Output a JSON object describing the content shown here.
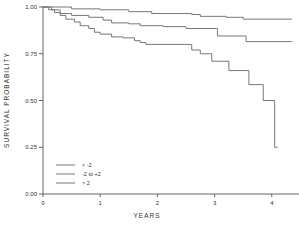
{
  "chart_data": {
    "type": "line",
    "title": "",
    "xlabel": "YEARS",
    "ylabel": "SURVIVAL PROBABILITY",
    "xlim": [
      0,
      4.35
    ],
    "ylim": [
      0,
      1.0
    ],
    "x_ticks": [
      "0",
      "1",
      "2",
      "3",
      "4"
    ],
    "y_ticks": [
      "0.00",
      "0.25",
      "0.50",
      "0.75",
      "1.00"
    ],
    "grid": false,
    "legend_position": "lower-left",
    "series": [
      {
        "name": "< -2",
        "step": true,
        "points": [
          [
            0,
            1.0
          ],
          [
            0.5,
            0.99
          ],
          [
            1.0,
            0.985
          ],
          [
            1.5,
            0.975
          ],
          [
            1.9,
            0.965
          ],
          [
            2.6,
            0.96
          ],
          [
            2.75,
            0.95
          ],
          [
            3.2,
            0.945
          ],
          [
            3.5,
            0.935
          ],
          [
            4.35,
            0.935
          ]
        ]
      },
      {
        "name": "-2 to +2",
        "step": true,
        "points": [
          [
            0,
            1.0
          ],
          [
            0.15,
            0.985
          ],
          [
            0.3,
            0.965
          ],
          [
            0.5,
            0.955
          ],
          [
            0.8,
            0.945
          ],
          [
            1.05,
            0.93
          ],
          [
            1.2,
            0.915
          ],
          [
            1.5,
            0.91
          ],
          [
            1.7,
            0.9
          ],
          [
            2.1,
            0.895
          ],
          [
            2.5,
            0.885
          ],
          [
            3.05,
            0.875
          ],
          [
            3.05,
            0.845
          ],
          [
            3.5,
            0.845
          ],
          [
            3.55,
            0.815
          ],
          [
            4.35,
            0.815
          ]
        ]
      },
      {
        "name": "> 2",
        "step": true,
        "points": [
          [
            0,
            1.0
          ],
          [
            0.1,
            0.985
          ],
          [
            0.2,
            0.97
          ],
          [
            0.3,
            0.955
          ],
          [
            0.4,
            0.935
          ],
          [
            0.55,
            0.92
          ],
          [
            0.65,
            0.9
          ],
          [
            0.8,
            0.885
          ],
          [
            0.9,
            0.865
          ],
          [
            1.0,
            0.855
          ],
          [
            1.2,
            0.84
          ],
          [
            1.4,
            0.835
          ],
          [
            1.6,
            0.82
          ],
          [
            1.7,
            0.81
          ],
          [
            1.8,
            0.8
          ],
          [
            2.6,
            0.8
          ],
          [
            2.6,
            0.77
          ],
          [
            2.75,
            0.77
          ],
          [
            2.75,
            0.75
          ],
          [
            2.95,
            0.75
          ],
          [
            2.95,
            0.71
          ],
          [
            3.25,
            0.71
          ],
          [
            3.25,
            0.66
          ],
          [
            3.6,
            0.66
          ],
          [
            3.6,
            0.585
          ],
          [
            3.85,
            0.585
          ],
          [
            3.85,
            0.5
          ],
          [
            4.05,
            0.5
          ],
          [
            4.05,
            0.25
          ],
          [
            4.1,
            0.25
          ]
        ]
      }
    ]
  },
  "legend": {
    "items": [
      {
        "label": "< -2"
      },
      {
        "label": "-2 to +2"
      },
      {
        "label": "> 2"
      }
    ]
  }
}
